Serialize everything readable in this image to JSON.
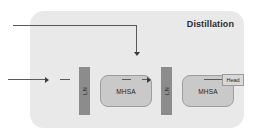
{
  "diagram": {
    "title": "Distillation",
    "blocks": {
      "norm_first": "LN",
      "norm_second": "LN",
      "attention_first": "MHSA",
      "attention_second": "MHSA",
      "head": "Head"
    },
    "icons": {
      "input_arrow": "arrow-right-icon",
      "attention_arrow": "arrow-right-icon",
      "skip_arrow": "arrow-down-icon"
    },
    "colors": {
      "panel_background": "#e9e9e9",
      "norm_bar": "#8c8c8c",
      "attention_block": "#c9c9c9",
      "head_block": "#d8d8d8",
      "connector": "#5a5a5a",
      "text": "#1e1e1e"
    }
  }
}
